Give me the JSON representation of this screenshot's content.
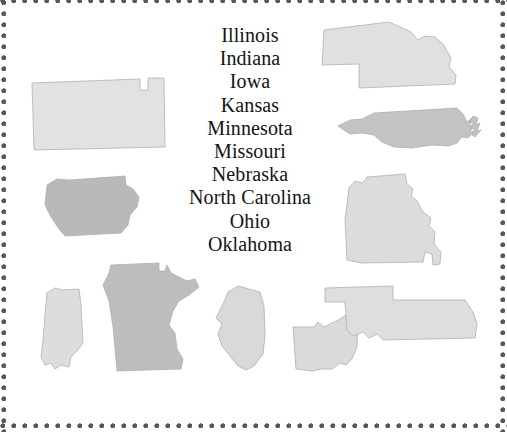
{
  "page": {
    "background_color": "#ffffff",
    "border": {
      "style": "dotted",
      "dot_color": "#58585c",
      "dot_diameter_px": 5,
      "dot_spacing_px": 11
    },
    "width_px": 507,
    "height_px": 432
  },
  "word_list": {
    "items": [
      "Illinois",
      "Indiana",
      "Iowa",
      "Kansas",
      "Minnesota",
      "Missouri",
      "Nebraska",
      "North Carolina",
      "Ohio",
      "Oklahoma"
    ],
    "text_color": "#141414",
    "font_size_px": 20
  },
  "shapes": [
    {
      "name": "kansas",
      "label": "Kansas",
      "fill": "#e2e2e2",
      "stroke": "#c9c9c9",
      "x": 28,
      "y": 74,
      "w": 138,
      "h": 76
    },
    {
      "name": "nebraska",
      "label": "Nebraska",
      "fill": "#e0e0e0",
      "stroke": "#c4c4c4",
      "x": 315,
      "y": 18,
      "w": 146,
      "h": 72
    },
    {
      "name": "north-carolina",
      "label": "North Carolina",
      "fill": "#c3c3c3",
      "stroke": "#b0b0b0",
      "x": 336,
      "y": 104,
      "w": 148,
      "h": 44
    },
    {
      "name": "iowa",
      "label": "Iowa",
      "fill": "#b9b9b9",
      "stroke": "#aaaaaa",
      "x": 41,
      "y": 171,
      "w": 105,
      "h": 68
    },
    {
      "name": "missouri",
      "label": "Missouri",
      "fill": "#dcdcdc",
      "stroke": "#c3c3c3",
      "x": 337,
      "y": 170,
      "w": 108,
      "h": 93
    },
    {
      "name": "indiana",
      "label": "Indiana",
      "fill": "#dddddd",
      "stroke": "#c6c6c6",
      "x": 33,
      "y": 281,
      "w": 54,
      "h": 92
    },
    {
      "name": "minnesota",
      "label": "Minnesota",
      "fill": "#bdbdbd",
      "stroke": "#ababab",
      "x": 95,
      "y": 255,
      "w": 108,
      "h": 118
    },
    {
      "name": "illinois",
      "label": "Illinois",
      "fill": "#d9d9d9",
      "stroke": "#c4c4c4",
      "x": 206,
      "y": 280,
      "w": 64,
      "h": 93
    },
    {
      "name": "ohio",
      "label": "Ohio",
      "fill": "#dadada",
      "stroke": "#c4c4c4",
      "x": 288,
      "y": 305,
      "w": 75,
      "h": 70
    },
    {
      "name": "oklahoma",
      "label": "Oklahoma",
      "fill": "#dedede",
      "stroke": "#c6c6c6",
      "x": 323,
      "y": 280,
      "w": 160,
      "h": 65
    }
  ]
}
